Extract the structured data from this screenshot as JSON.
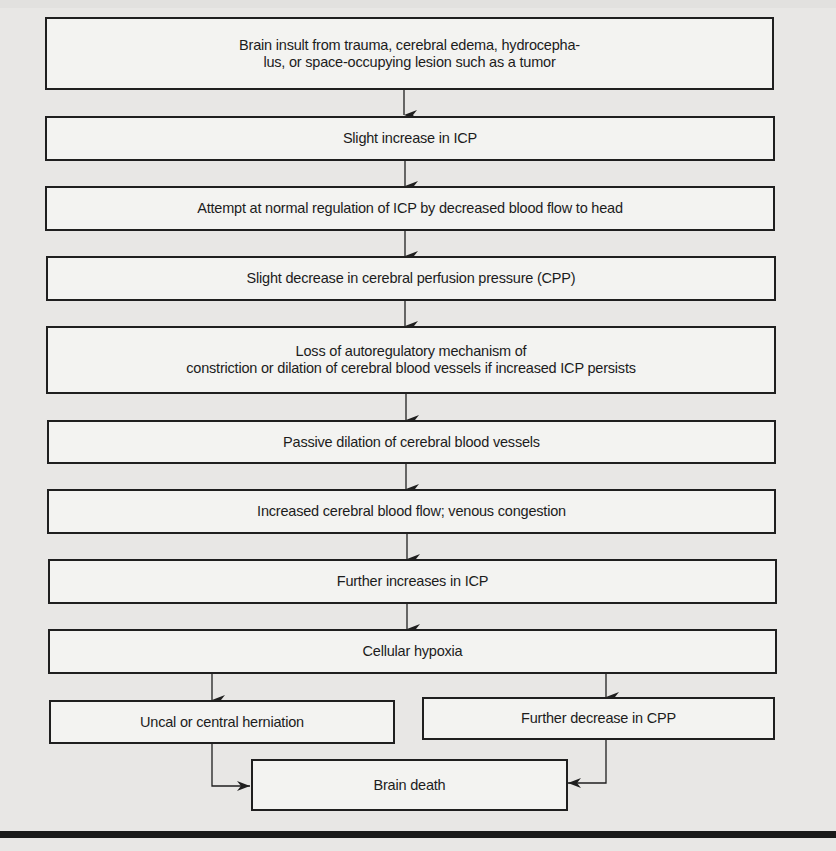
{
  "diagram": {
    "type": "flowchart",
    "colors": {
      "background": "#e8e7e5",
      "box_fill": "#f3f3f1",
      "stroke": "#1f1f1f",
      "text": "#1c1c1c"
    },
    "nodes": [
      {
        "id": "n1",
        "lines": [
          "Brain insult from trauma, cerebral edema, hydrocepha-",
          "lus, or space-occupying lesion such as a tumor"
        ]
      },
      {
        "id": "n2",
        "lines": [
          "Slight increase in ICP"
        ]
      },
      {
        "id": "n3",
        "lines": [
          "Attempt at normal regulation of ICP by decreased blood flow to head"
        ]
      },
      {
        "id": "n4",
        "lines": [
          "Slight decrease in cerebral perfusion pressure (CPP)"
        ]
      },
      {
        "id": "n5",
        "lines": [
          "Loss of autoregulatory mechanism of",
          "constriction or dilation of cerebral blood vessels if increased ICP persists"
        ]
      },
      {
        "id": "n6",
        "lines": [
          "Passive dilation of cerebral blood vessels"
        ]
      },
      {
        "id": "n7",
        "lines": [
          "Increased cerebral blood flow; venous congestion"
        ]
      },
      {
        "id": "n8",
        "lines": [
          "Further increases in ICP"
        ]
      },
      {
        "id": "n9",
        "lines": [
          "Cellular hypoxia"
        ]
      },
      {
        "id": "n10",
        "lines": [
          "Uncal or central herniation"
        ]
      },
      {
        "id": "n11",
        "lines": [
          "Further decrease in CPP"
        ]
      },
      {
        "id": "n12",
        "lines": [
          "Brain death"
        ]
      }
    ],
    "edges": [
      {
        "from": "n1",
        "to": "n2"
      },
      {
        "from": "n2",
        "to": "n3"
      },
      {
        "from": "n3",
        "to": "n4"
      },
      {
        "from": "n4",
        "to": "n5"
      },
      {
        "from": "n5",
        "to": "n6"
      },
      {
        "from": "n6",
        "to": "n7"
      },
      {
        "from": "n7",
        "to": "n8"
      },
      {
        "from": "n8",
        "to": "n9"
      },
      {
        "from": "n9",
        "to": "n10"
      },
      {
        "from": "n9",
        "to": "n11"
      },
      {
        "from": "n10",
        "to": "n12"
      },
      {
        "from": "n11",
        "to": "n12"
      }
    ]
  }
}
